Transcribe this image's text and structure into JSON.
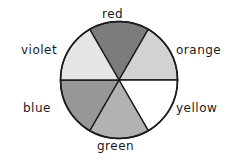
{
  "wheel": {
    "segments": [
      {
        "name": "red",
        "label": "red",
        "shade": "#7c7c7c"
      },
      {
        "name": "orange",
        "label": "orange",
        "shade": "#d2d2d2"
      },
      {
        "name": "yellow",
        "label": "yellow",
        "shade": "#ffffff"
      },
      {
        "name": "green",
        "label": "green",
        "shade": "#b2b2b2"
      },
      {
        "name": "blue",
        "label": "blue",
        "shade": "#979797"
      },
      {
        "name": "violet",
        "label": "violet",
        "shade": "#e6e6e6"
      }
    ]
  }
}
